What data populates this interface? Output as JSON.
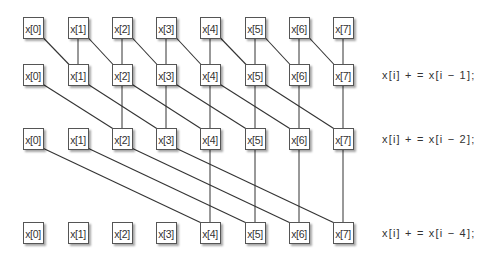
{
  "diagram": {
    "type": "parallel-prefix-sum",
    "columns": [
      "x[0]",
      "x[1]",
      "x[2]",
      "x[3]",
      "x[4]",
      "x[5]",
      "x[6]",
      "x[7]"
    ],
    "rows": [
      {
        "label": ""
      },
      {
        "label": "x[i] + = x[i − 1];",
        "offset": 1
      },
      {
        "label": "x[i] + = x[i − 2];",
        "offset": 2
      },
      {
        "label": "x[i] + = x[i − 4];",
        "offset": 4
      }
    ],
    "colors": {
      "line": "#333333",
      "box_border": "#555555",
      "text": "#333333"
    }
  }
}
